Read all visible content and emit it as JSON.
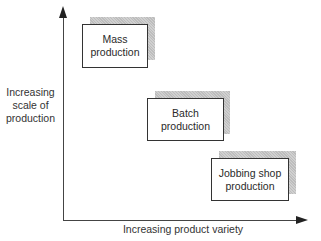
{
  "diagram": {
    "y_axis_label": "Increasing scale of production",
    "x_axis_label": "Increasing product variety",
    "boxes": [
      {
        "label_line1": "Mass",
        "label_line2": "production"
      },
      {
        "label_line1": "Batch",
        "label_line2": "production"
      },
      {
        "label_line1": "Jobbing shop",
        "label_line2": "production"
      }
    ]
  }
}
